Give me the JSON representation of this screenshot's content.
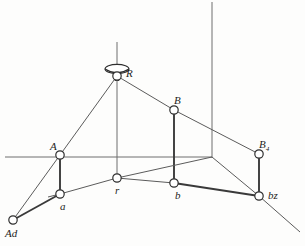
{
  "figure": {
    "background_color": "#fdfdfc",
    "line_color": "#5b5b5b",
    "bold_line_color": "#3a3a3a",
    "node_fill": "#ffffff",
    "node_stroke": "#2e2e2e",
    "width": 305,
    "height": 246
  },
  "nodes": [
    {
      "id": "R",
      "label": "R",
      "sub": "",
      "x": 117,
      "y": 76,
      "r": 4.2,
      "label_x": 126,
      "label_y": 68
    },
    {
      "id": "A",
      "label": "A",
      "sub": "",
      "x": 60,
      "y": 155,
      "r": 4.2,
      "label_x": 50,
      "label_y": 141
    },
    {
      "id": "a",
      "label": "a",
      "sub": "",
      "x": 60,
      "y": 194,
      "r": 4.2,
      "label_x": 60,
      "label_y": 201
    },
    {
      "id": "Ad",
      "label": "Ad",
      "sub": "",
      "x": 13,
      "y": 220,
      "r": 4.2,
      "label_x": 5,
      "label_y": 228
    },
    {
      "id": "B",
      "label": "B",
      "sub": "",
      "x": 174,
      "y": 110,
      "r": 4.2,
      "label_x": 174,
      "label_y": 95
    },
    {
      "id": "b",
      "label": "b",
      "sub": "",
      "x": 174,
      "y": 183,
      "r": 4.2,
      "label_x": 175,
      "label_y": 190
    },
    {
      "id": "r",
      "label": "r",
      "sub": "",
      "x": 117,
      "y": 178,
      "r": 4.2,
      "label_x": 115,
      "label_y": 185
    },
    {
      "id": "Bq",
      "label": "B",
      "sub": "4",
      "x": 259,
      "y": 154,
      "r": 4.2,
      "label_x": 259,
      "label_y": 139
    },
    {
      "id": "bz",
      "label": "bz",
      "sub": "",
      "x": 259,
      "y": 196,
      "r": 4.2,
      "label_x": 268,
      "label_y": 190
    }
  ],
  "axes": [
    {
      "name": "vertical-axis-through-R",
      "x1": 117,
      "y1": 42,
      "x2": 117,
      "y2": 178
    },
    {
      "name": "horizontal-ground-axis",
      "x1": 5,
      "y1": 157,
      "x2": 212,
      "y2": 157
    },
    {
      "name": "vertical-right-axis",
      "x1": 212,
      "y1": 2,
      "x2": 212,
      "y2": 158
    }
  ],
  "edges": [
    {
      "name": "edge-R-A",
      "x1": 117,
      "y1": 76,
      "x2": 60,
      "y2": 155,
      "weight": "thin"
    },
    {
      "name": "edge-A-Ad",
      "x1": 60,
      "y1": 155,
      "x2": 13,
      "y2": 220,
      "weight": "thin"
    },
    {
      "name": "edge-R-B",
      "x1": 117,
      "y1": 76,
      "x2": 174,
      "y2": 110,
      "weight": "thin"
    },
    {
      "name": "edge-B-Bq",
      "x1": 174,
      "y1": 110,
      "x2": 259,
      "y2": 154,
      "weight": "thin"
    },
    {
      "name": "edge-A-a",
      "x1": 60,
      "y1": 155,
      "x2": 60,
      "y2": 194,
      "weight": "bold"
    },
    {
      "name": "edge-B-b",
      "x1": 174,
      "y1": 110,
      "x2": 174,
      "y2": 183,
      "weight": "bold"
    },
    {
      "name": "edge-Bq-bz",
      "x1": 259,
      "y1": 154,
      "x2": 259,
      "y2": 196,
      "weight": "bold"
    },
    {
      "name": "edge-Ad-a",
      "x1": 13,
      "y1": 220,
      "x2": 60,
      "y2": 194,
      "weight": "bold"
    },
    {
      "name": "edge-a-r",
      "x1": 60,
      "y1": 194,
      "x2": 117,
      "y2": 178,
      "weight": "thin"
    },
    {
      "name": "edge-r-b",
      "x1": 117,
      "y1": 178,
      "x2": 174,
      "y2": 183,
      "weight": "thin"
    },
    {
      "name": "edge-b-bz",
      "x1": 174,
      "y1": 183,
      "x2": 259,
      "y2": 196,
      "weight": "bold"
    },
    {
      "name": "edge-r-ground-right",
      "x1": 117,
      "y1": 178,
      "x2": 212,
      "y2": 157,
      "weight": "thin"
    },
    {
      "name": "edge-ground-right-bz",
      "x1": 212,
      "y1": 157,
      "x2": 259,
      "y2": 196,
      "weight": "thin"
    },
    {
      "name": "edge-bz-extension",
      "x1": 259,
      "y1": 196,
      "x2": 300,
      "y2": 232,
      "weight": "thin"
    },
    {
      "name": "edge-a-ground-left",
      "x1": 60,
      "y1": 194,
      "x2": 48,
      "y2": 197,
      "weight": "thin"
    }
  ],
  "pulley": {
    "name": "pulley-cap-at-R",
    "cap_cx": 117,
    "cap_cy": 69,
    "cap_rx": 12,
    "cap_ry": 4.6,
    "body_cx": 117,
    "body_cy": 76,
    "body_w": 7,
    "body_h": 9
  }
}
